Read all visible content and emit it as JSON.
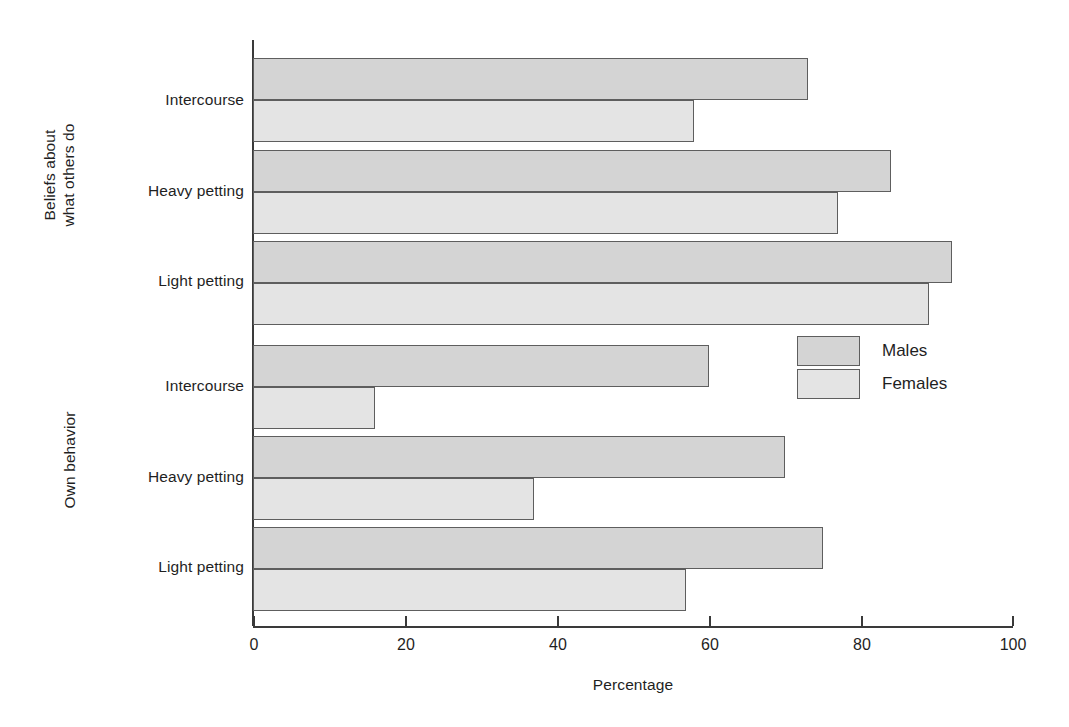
{
  "chart_data": {
    "type": "bar",
    "orientation": "horizontal",
    "title": "",
    "xlabel": "Percentage",
    "ylabel": "",
    "xlim": [
      0,
      100
    ],
    "xticks": [
      0,
      20,
      40,
      60,
      80,
      100
    ],
    "xticklabels": [
      "0",
      "20",
      "40",
      "60",
      "80",
      "100"
    ],
    "grid": false,
    "legend": {
      "position": "center-right",
      "entries": [
        {
          "name": "Males",
          "color": "#d4d4d4"
        },
        {
          "name": "Females",
          "color": "#e4e4e4"
        }
      ]
    },
    "groups": [
      {
        "name": "Beliefs about\nwhat others do",
        "categories": [
          "Intercourse",
          "Heavy petting",
          "Light petting"
        ],
        "series": [
          {
            "name": "Males",
            "values": [
              73,
              84,
              92
            ]
          },
          {
            "name": "Females",
            "values": [
              58,
              77,
              89
            ]
          }
        ]
      },
      {
        "name": "Own behavior",
        "categories": [
          "Intercourse",
          "Heavy petting",
          "Light petting"
        ],
        "series": [
          {
            "name": "Males",
            "values": [
              60,
              70,
              75
            ]
          },
          {
            "name": "Females",
            "values": [
              16,
              37,
              57
            ]
          }
        ]
      }
    ]
  },
  "axis": {
    "x_title": "Percentage",
    "tick_labels": [
      "0",
      "20",
      "40",
      "60",
      "80",
      "100"
    ]
  },
  "groups": {
    "beliefs": {
      "label": "Beliefs about\nwhat others do",
      "categories": [
        "Intercourse",
        "Heavy petting",
        "Light petting"
      ]
    },
    "own": {
      "label": "Own behavior",
      "categories": [
        "Intercourse",
        "Heavy petting",
        "Light petting"
      ]
    }
  },
  "legend": {
    "males_label": "Males",
    "females_label": "Females"
  },
  "colors": {
    "males": "#d4d4d4",
    "females": "#e4e4e4",
    "bar_border": "#5e5e5e",
    "axis": "#3a3a3a",
    "text": "#1f1f1f",
    "background": "#ffffff"
  }
}
